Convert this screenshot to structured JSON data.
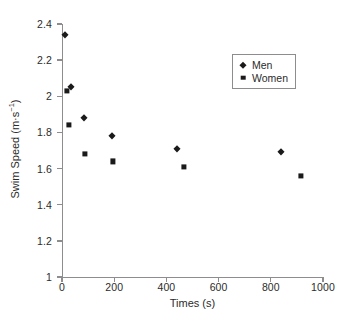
{
  "chart_data": {
    "type": "scatter",
    "title": "",
    "xlabel": "Times (s)",
    "ylabel": "Swim Speed (m·s⁻¹)",
    "ylabel_base": "Swim Speed (m·s",
    "ylabel_sup": "−1",
    "ylabel_tail": ")",
    "xlim": [
      0,
      1000
    ],
    "ylim": [
      1,
      2.4
    ],
    "xticks": [
      0,
      200,
      400,
      600,
      800,
      1000
    ],
    "yticks": [
      1,
      1.2,
      1.4,
      1.6,
      1.8,
      2,
      2.2,
      2.4
    ],
    "xticklabels": [
      "0",
      "200",
      "400",
      "600",
      "800",
      "1000"
    ],
    "yticklabels": [
      "1",
      "1.2",
      "1.4",
      "1.6",
      "1.8",
      "2",
      "2.2",
      "2.4"
    ],
    "grid": false,
    "legend_position": "upper right",
    "marker_color": "#1a1a1a",
    "axis_color": "#8d8d8d",
    "series": [
      {
        "name": "Men",
        "marker": "diamond",
        "points": [
          {
            "x": 10,
            "y": 2.34
          },
          {
            "x": 35,
            "y": 2.05
          },
          {
            "x": 85,
            "y": 1.88
          },
          {
            "x": 190,
            "y": 1.78
          },
          {
            "x": 440,
            "y": 1.71
          },
          {
            "x": 840,
            "y": 1.69
          }
        ]
      },
      {
        "name": "Women",
        "marker": "square",
        "points": [
          {
            "x": 20,
            "y": 2.03
          },
          {
            "x": 25,
            "y": 1.84
          },
          {
            "x": 88,
            "y": 1.68
          },
          {
            "x": 195,
            "y": 1.64
          },
          {
            "x": 468,
            "y": 1.61
          },
          {
            "x": 915,
            "y": 1.56
          }
        ]
      }
    ]
  }
}
